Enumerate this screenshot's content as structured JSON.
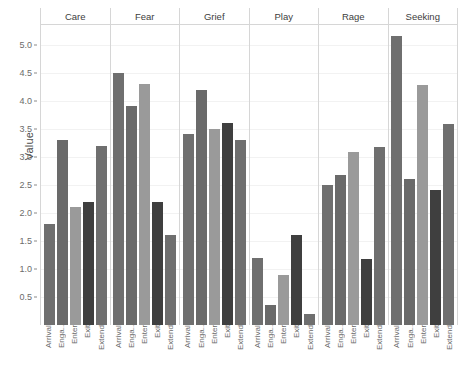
{
  "chart_data": {
    "type": "bar",
    "title": "",
    "subtitle": "",
    "xlabel": "",
    "ylabel": "Value",
    "ylim": [
      0,
      5.35
    ],
    "yticks": [
      0.5,
      1.0,
      1.5,
      2.0,
      2.5,
      3.0,
      3.5,
      4.0,
      4.5,
      5.0
    ],
    "ytick_labels": [
      "0.5",
      "1.0",
      "1.5",
      "2.0",
      "2.5",
      "3.0",
      "3.5",
      "4.0",
      "4.5",
      "5.0"
    ],
    "grid": true,
    "legend_position": "none",
    "facet_label": "emotion",
    "facets": [
      "Care",
      "Fear",
      "Grief",
      "Play",
      "Rage",
      "Seeking"
    ],
    "categories": [
      "Arrival",
      "Enga..",
      "Enter",
      "Exit",
      "Extend"
    ],
    "bar_colors": [
      "#6f6f6f",
      "#6a6a6a",
      "#9a9a9a",
      "#3f3f3f",
      "#6f6f6f"
    ],
    "panels": [
      {
        "name": "Care",
        "categories": [
          "Arrival",
          "Enga..",
          "Enter",
          "Exit",
          "Extend"
        ],
        "values": [
          1.8,
          3.3,
          2.1,
          2.2,
          3.2
        ]
      },
      {
        "name": "Fear",
        "categories": [
          "Arrival",
          "Enga..",
          "Enter",
          "Exit",
          "Extend"
        ],
        "values": [
          4.5,
          3.9,
          4.3,
          2.2,
          1.6
        ]
      },
      {
        "name": "Grief",
        "categories": [
          "Arrival",
          "Enga..",
          "Enter",
          "Exit",
          "Extend"
        ],
        "values": [
          3.4,
          4.2,
          3.5,
          3.6,
          3.3
        ]
      },
      {
        "name": "Play",
        "categories": [
          "Arrival",
          "Enga..",
          "Enter",
          "Exit",
          "Extend"
        ],
        "values": [
          1.2,
          0.35,
          0.9,
          1.6,
          0.2
        ]
      },
      {
        "name": "Rage",
        "categories": [
          "Arrival",
          "Enga..",
          "Enter",
          "Exit",
          "Extend"
        ],
        "values": [
          2.5,
          2.68,
          3.08,
          1.18,
          3.18
        ]
      },
      {
        "name": "Seeking",
        "categories": [
          "Arrival",
          "Enga..",
          "Enter",
          "Exit",
          "Extend"
        ],
        "values": [
          5.15,
          2.6,
          4.28,
          2.4,
          3.58
        ]
      }
    ]
  }
}
